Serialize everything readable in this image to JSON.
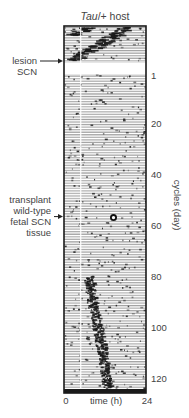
{
  "chart_data": {
    "type": "heatmap",
    "subtype": "double-plotted actogram (single-plotted rows)",
    "title": "Tau/+ host",
    "title_italic_part": "Tau",
    "xlabel": "time (h)",
    "ylabel": "cycles (day)",
    "x_range": [
      0,
      24
    ],
    "x_ticks": [
      "0",
      "24"
    ],
    "y_range": [
      1,
      126
    ],
    "y_ticks": [
      1,
      20,
      40,
      60,
      80,
      100,
      120
    ],
    "y_tick_labels": [
      "1",
      "20",
      "40",
      "60",
      "80",
      "100",
      "120"
    ],
    "pre_lesion_cycles": 14,
    "annotations": [
      {
        "text_lines": [
          "lesion",
          "SCN"
        ],
        "arrow": "right",
        "at_cycle": 0,
        "name": "lesion-scn"
      },
      {
        "text_lines": [
          "transplant",
          "wild-type",
          "fetal SCN",
          "tissue"
        ],
        "arrow": "right",
        "at_cycle": 57,
        "name": "transplant-annotation"
      }
    ],
    "marker": {
      "shape": "open-circle",
      "cycle": 57,
      "time_h": 14.5
    },
    "activity_bands": [
      {
        "phase": "pre-lesion",
        "description": "short-period rhythm (Tau), onset drifts earlier each cycle",
        "points": [
          [
            -14,
            18
          ],
          [
            -10,
            13
          ],
          [
            -6,
            8
          ],
          [
            -1,
            2
          ]
        ]
      },
      {
        "phase": "pre-lesion-wrap",
        "description": "wrapped band",
        "points": [
          [
            -14,
            6
          ],
          [
            -11,
            2
          ]
        ]
      },
      {
        "phase": "post-transplant",
        "description": "restored wild-type-like rhythm drifting later",
        "points": [
          [
            80,
            7
          ],
          [
            90,
            8
          ],
          [
            100,
            9.5
          ],
          [
            110,
            11
          ],
          [
            124,
            12.5
          ]
        ]
      }
    ],
    "gap_rows": {
      "description": "post-lesion arrhythmic blank",
      "from_cycle": -0.5,
      "to_cycle": 0.5
    },
    "colors": {
      "ink": "#1a1a1a",
      "paper": "#ffffff",
      "row_gray": "#8f8f8f"
    }
  }
}
